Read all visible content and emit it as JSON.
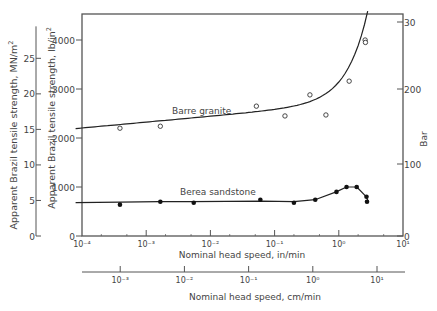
{
  "chart_data": {
    "type": "scatter",
    "title": "",
    "xlabel": "Nominal head speed,   in/min",
    "xlabel_secondary": "Nominal head speed,   cm/min",
    "ylabel_left_outer": "Apparent   Brazil   tensile   strength,   MN/m",
    "ylabel_left_inner": "Apparent   Brazil   tensile   strength,   lb/in",
    "ylabel_right": "Bar",
    "x_scale": "log",
    "xlim": [
      0.0001,
      10
    ],
    "ylim": [
      0,
      4500
    ],
    "x_ticks": [
      "10⁻⁴",
      "10⁻³",
      "10⁻²",
      "10⁻¹",
      "10⁰",
      "10¹"
    ],
    "x_ticks_secondary": [
      "10⁻³",
      "10⁻²",
      "10⁻¹",
      "10⁰",
      "10¹"
    ],
    "y_ticks_lb": [
      "0",
      "1000",
      "2000",
      "3000",
      "4000"
    ],
    "y_ticks_MN": [
      "0",
      "5",
      "10",
      "15",
      "20",
      "25"
    ],
    "y_ticks_bar": [
      "0",
      "100",
      "200",
      "30"
    ],
    "series": [
      {
        "name": "Barre granite",
        "marker": "open-circle",
        "x": [
          0.00039,
          0.00166,
          0.052,
          0.145,
          0.355,
          0.63,
          1.45,
          2.57,
          2.6
        ],
        "y": [
          2200,
          2240,
          2650,
          2450,
          2880,
          2470,
          3160,
          4000,
          3950
        ]
      },
      {
        "name": "Berea sandstone",
        "marker": "filled-circle",
        "x": [
          0.00039,
          0.00166,
          0.0055,
          0.06,
          0.2,
          0.43,
          0.92,
          1.32,
          1.9,
          2.7,
          2.75
        ],
        "y": [
          640,
          700,
          680,
          740,
          680,
          740,
          900,
          1000,
          1000,
          800,
          700
        ]
      }
    ]
  },
  "labels": {
    "granite": "Barre   granite",
    "sandstone": "Berea   sandstone",
    "mn_sup": "2",
    "lb_sup": "2"
  }
}
